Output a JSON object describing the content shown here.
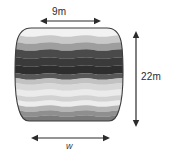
{
  "figure": {
    "background_color": "#ffffff",
    "outline_color": "#3d3d3d",
    "annotation_color": "#2b2b2b"
  },
  "dimensions": {
    "top_width": {
      "label": "9m",
      "value": 9,
      "unit": "m",
      "orientation": "horizontal",
      "position": "top"
    },
    "height": {
      "label": "22m",
      "value": 22,
      "unit": "m",
      "orientation": "vertical",
      "position": "right"
    },
    "bottom_width": {
      "label": "w",
      "value": null,
      "unit": "m",
      "orientation": "horizontal",
      "position": "bottom"
    }
  },
  "shape": {
    "name": "rounded-barrel",
    "flat_top": true,
    "flat_bottom": true,
    "bands": [
      {
        "index": 0,
        "color": "#f2f2f2"
      },
      {
        "index": 1,
        "color": "#c9c9c9"
      },
      {
        "index": 2,
        "color": "#9e9e9e"
      },
      {
        "index": 3,
        "color": "#4a4a4a"
      },
      {
        "index": 4,
        "color": "#3a3a3a"
      },
      {
        "index": 5,
        "color": "#2e2e2e"
      },
      {
        "index": 6,
        "color": "#585858"
      },
      {
        "index": 7,
        "color": "#c2c2c2"
      },
      {
        "index": 8,
        "color": "#d8d8d8"
      },
      {
        "index": 9,
        "color": "#ebebeb"
      },
      {
        "index": 10,
        "color": "#d2d2d2"
      },
      {
        "index": 11,
        "color": "#ededed"
      },
      {
        "index": 12,
        "color": "#b5b5b5"
      },
      {
        "index": 13,
        "color": "#8f8f8f"
      },
      {
        "index": 14,
        "color": "#7a7a7a"
      },
      {
        "index": 15,
        "color": "#a8a8a8"
      }
    ]
  }
}
